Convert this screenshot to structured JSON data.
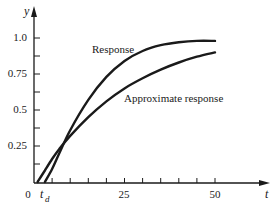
{
  "chart_data": {
    "type": "line",
    "title": "",
    "xlabel": "t",
    "ylabel": "y",
    "xlim": [
      0,
      50
    ],
    "ylim": [
      0,
      1.0
    ],
    "grid": false,
    "legend_position": "inline annotations",
    "x_ticks": [
      0,
      5,
      10,
      15,
      20,
      25,
      30,
      35,
      40,
      45,
      50
    ],
    "x_tick_labels": [
      {
        "value": 0,
        "label": "0"
      },
      {
        "value": 25,
        "label": "25"
      },
      {
        "value": 50,
        "label": "50"
      }
    ],
    "y_ticks": [
      0.125,
      0.25,
      0.375,
      0.5,
      0.625,
      0.75,
      0.875,
      1.0
    ],
    "y_tick_labels": [
      {
        "value": 0.25,
        "label": "0.25"
      },
      {
        "value": 0.5,
        "label": "0.5"
      },
      {
        "value": 0.75,
        "label": "0.75"
      },
      {
        "value": 1.0,
        "label": "1.0"
      }
    ],
    "annotations": [
      {
        "text": "t",
        "subscript": "d",
        "x": 3,
        "y": 0,
        "meaning": "dead time marker on t-axis"
      }
    ],
    "series": [
      {
        "name": "Response",
        "x": [
          3,
          5,
          7,
          10,
          15,
          20,
          25,
          30,
          35,
          40,
          45,
          50
        ],
        "y": [
          0.0,
          0.09,
          0.2,
          0.36,
          0.57,
          0.73,
          0.84,
          0.91,
          0.95,
          0.97,
          0.98,
          0.98
        ]
      },
      {
        "name": "Approximate response",
        "x": [
          1,
          3,
          5,
          7,
          10,
          15,
          20,
          25,
          30,
          35,
          40,
          45,
          50
        ],
        "y": [
          0.0,
          0.08,
          0.16,
          0.23,
          0.32,
          0.45,
          0.56,
          0.65,
          0.72,
          0.78,
          0.83,
          0.87,
          0.9
        ]
      }
    ]
  },
  "labels": {
    "y_axis": "y",
    "x_axis": "t",
    "origin": "0",
    "td_main": "t",
    "td_sub": "d",
    "series_response": "Response",
    "series_approx": "Approximate response",
    "tick_1_0": "1.0",
    "tick_0_75": "0.75",
    "tick_0_5": "0.5",
    "tick_0_25": "0.25",
    "tick_25": "25",
    "tick_50": "50"
  }
}
